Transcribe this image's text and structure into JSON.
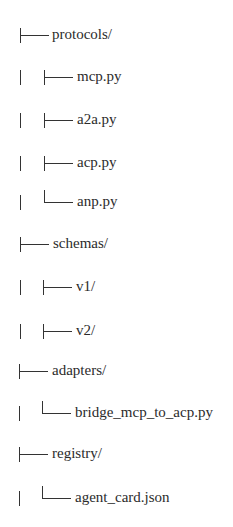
{
  "tree": {
    "rows": [
      {
        "label": "protocols/",
        "depth": 1,
        "connector": "tee",
        "type": "folder"
      },
      {
        "label": "mcp.py",
        "depth": 2,
        "connector": "tee",
        "type": "file"
      },
      {
        "label": "a2a.py",
        "depth": 2,
        "connector": "tee",
        "type": "file"
      },
      {
        "label": "acp.py",
        "depth": 2,
        "connector": "tee",
        "type": "file"
      },
      {
        "label": "anp.py",
        "depth": 2,
        "connector": "corner",
        "type": "file"
      },
      {
        "label": "schemas/",
        "depth": 1,
        "connector": "tee",
        "type": "folder"
      },
      {
        "label": "v1/",
        "depth": 2,
        "connector": "tee",
        "type": "folder"
      },
      {
        "label": "v2/",
        "depth": 2,
        "connector": "tee",
        "type": "folder"
      },
      {
        "label": "adapters/",
        "depth": 1,
        "connector": "tee",
        "type": "folder"
      },
      {
        "label": "bridge_mcp_to_acp.py",
        "depth": 2,
        "connector": "corner",
        "type": "file"
      },
      {
        "label": "registry/",
        "depth": 1,
        "connector": "tee",
        "type": "folder"
      },
      {
        "label": "agent_card.json",
        "depth": 2,
        "connector": "corner",
        "type": "file"
      }
    ]
  }
}
